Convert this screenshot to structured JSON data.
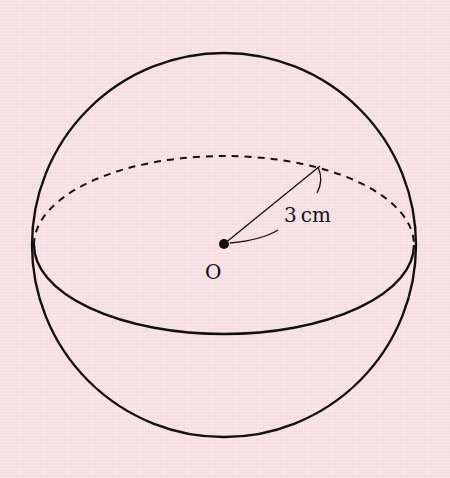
{
  "diagram": {
    "type": "sphere",
    "background_color": "#f6dde3",
    "stroke_color": "#111111",
    "center_label": "O",
    "radius_label": "3cm",
    "radius_label_number": "3",
    "radius_label_unit": "cm"
  }
}
